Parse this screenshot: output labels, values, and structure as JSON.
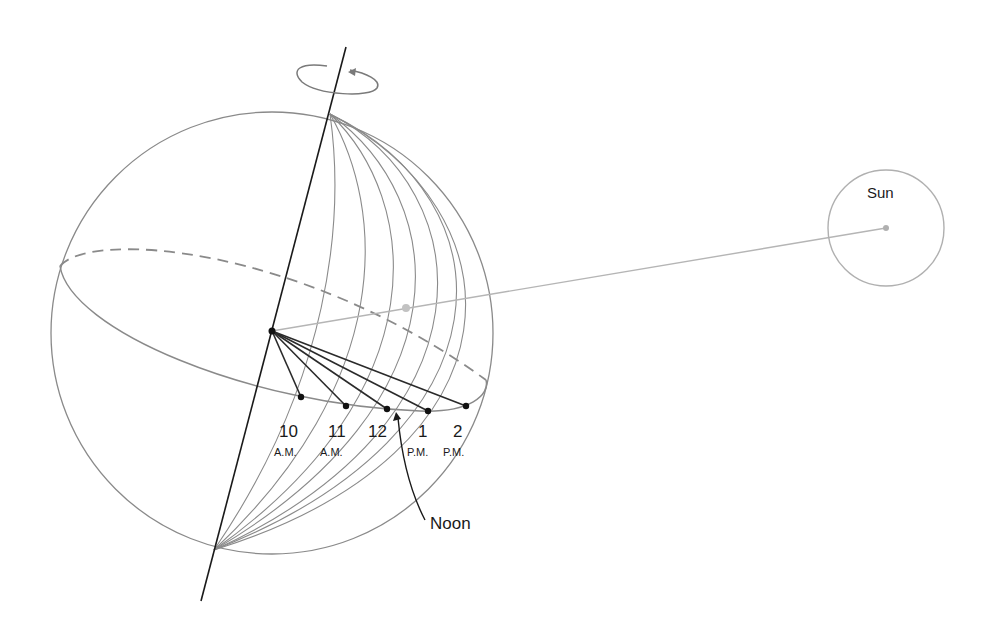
{
  "diagram": {
    "sun": {
      "label": "Sun"
    },
    "noon_label": "Noon",
    "hour_marks": [
      {
        "hour": "10",
        "period": "A.M."
      },
      {
        "hour": "11",
        "period": "A.M."
      },
      {
        "hour": "12",
        "period": ""
      },
      {
        "hour": "1",
        "period": "P.M."
      },
      {
        "hour": "2",
        "period": "P.M."
      }
    ],
    "colors": {
      "outline": "#8a8a8a",
      "axis": "#1a1a1a",
      "sun_ray": "#b5b5b5",
      "hour_line": "#2a2a2a"
    }
  }
}
